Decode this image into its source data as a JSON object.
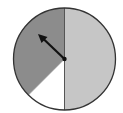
{
  "spinner": {
    "center": [
      64.5,
      59
    ],
    "radius": 51,
    "sectors": [
      {
        "name": "light-gray",
        "color": "#c6c6c6",
        "start_deg": 0,
        "end_deg": 180,
        "fraction": 0.5
      },
      {
        "name": "dark-gray",
        "color": "#8c8c8c",
        "start_deg": 180,
        "end_deg": 315,
        "fraction": 0.375
      },
      {
        "name": "white",
        "color": "#ffffff",
        "start_deg": 315,
        "end_deg": 360,
        "fraction": 0.125
      }
    ],
    "outline_color": "#333333",
    "arrow": {
      "color": "#111111",
      "tip": [
        39,
        35
      ]
    }
  }
}
